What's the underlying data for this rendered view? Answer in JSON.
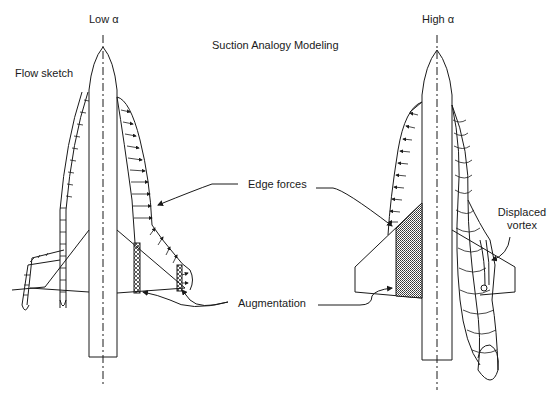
{
  "title": "Suction Analogy Modeling",
  "labels": {
    "flow_sketch": "Flow sketch",
    "low_alpha": "Low α",
    "high_alpha": "High α",
    "edge_forces": "Edge forces",
    "augmentation": "Augmentation",
    "displaced_vortex_line1": "Displaced",
    "displaced_vortex_line2": "vortex"
  },
  "colors": {
    "ink": "#1a1a1a",
    "background": "#ffffff",
    "hatch": "#555555"
  }
}
